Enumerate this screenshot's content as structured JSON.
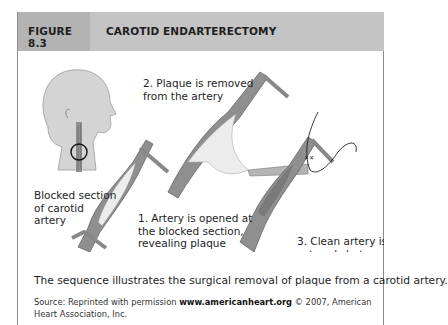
{
  "figure": {
    "number": "FIGURE 8.3",
    "title": "CAROTID ENDARTERECTOMY",
    "colors": {
      "header_number_bg": "#b3b3b3",
      "header_title_bg": "#c4c4c4",
      "artery": "#8f8f8f",
      "plaque": "#ececec",
      "head": "#d4d4d4"
    }
  },
  "illustration": {
    "labels": {
      "blocked": "Blocked section\nof carotid\nartery",
      "step1": "1. Artery is opened at\nthe blocked section,\nrevealing plaque",
      "step2": "2. Plaque is removed\nfrom the artery",
      "step3": "3. Clean artery is\nsutured shut"
    },
    "icons": [
      "head-profile-icon",
      "artery-opened-icon",
      "plaque-removal-icon",
      "sutured-artery-icon"
    ]
  },
  "caption": "The sequence illustrates the surgical removal of plaque from a carotid artery.",
  "source": {
    "prefix": "Source: Reprinted with permission ",
    "url": "www.americanheart.org",
    "suffix": " © 2007, American Heart Association, Inc."
  }
}
